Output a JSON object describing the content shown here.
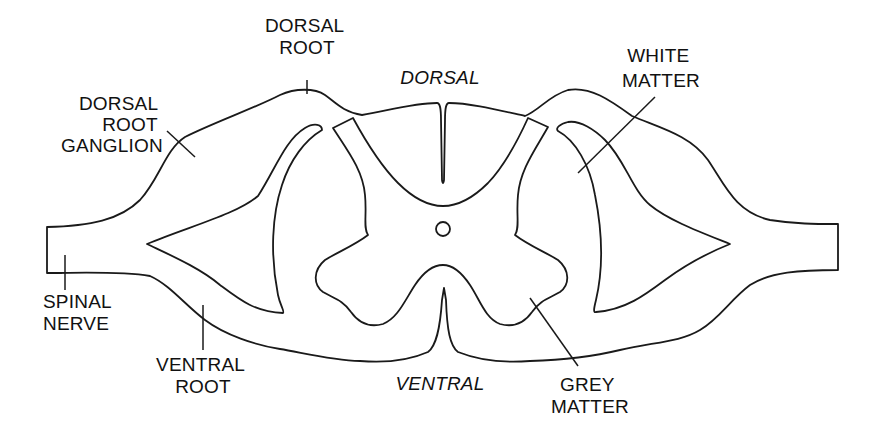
{
  "figure": {
    "colors": {
      "background": "#ffffff",
      "white_matter": "#e6e6e6",
      "grey_matter": "#a9a9a9",
      "outline": "#1a1a1a",
      "text": "#111111"
    }
  },
  "labels": {
    "dorsal_root": [
      "DORSAL",
      "ROOT"
    ],
    "dorsal_root_ganglion": [
      "DORSAL",
      "ROOT",
      "GANGLION"
    ],
    "dorsal": "DORSAL",
    "white_matter": [
      "WHITE",
      "MATTER"
    ],
    "spinal_nerve": [
      "SPINAL",
      "NERVE"
    ],
    "ventral_root": [
      "VENTRAL",
      "ROOT"
    ],
    "ventral": "VENTRAL",
    "grey_matter": [
      "GREY",
      "MATTER"
    ]
  }
}
